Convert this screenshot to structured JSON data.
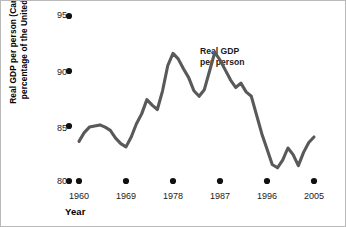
{
  "chart_data": {
    "type": "line",
    "title": "",
    "xlabel": "Year",
    "ylabel": "Real GDP per person (Canada as a percentage of the United States)",
    "annotation": "Real GDP per person",
    "annotation_line1": "Real GDP",
    "annotation_line2": "per person",
    "series_name": "Real GDP per person",
    "series_color": "#595959",
    "grid": false,
    "legend": "none",
    "xlim": [
      1960,
      2005
    ],
    "ylim": [
      80,
      95
    ],
    "xticks": [
      1960,
      1969,
      1978,
      1987,
      1996,
      2005
    ],
    "xtick_labels": [
      "1960",
      "1969",
      "1978",
      "1987",
      "1996",
      "2005"
    ],
    "yticks": [
      80,
      85,
      90,
      95
    ],
    "ytick_labels": [
      "80",
      "85",
      "90",
      "95"
    ],
    "x": [
      1960,
      1961,
      1962,
      1963,
      1964,
      1965,
      1966,
      1967,
      1968,
      1969,
      1970,
      1971,
      1972,
      1973,
      1974,
      1975,
      1976,
      1977,
      1978,
      1979,
      1980,
      1981,
      1982,
      1983,
      1984,
      1985,
      1986,
      1987,
      1988,
      1989,
      1990,
      1991,
      1992,
      1993,
      1994,
      1995,
      1996,
      1997,
      1998,
      1999,
      2000,
      2001,
      2002,
      2003,
      2004,
      2005
    ],
    "values": [
      83.6,
      84.4,
      84.9,
      85.0,
      85.1,
      84.9,
      84.6,
      83.9,
      83.4,
      83.1,
      84.0,
      85.2,
      86.1,
      87.4,
      86.9,
      86.5,
      88.2,
      90.5,
      91.6,
      91.1,
      90.2,
      89.4,
      88.2,
      87.7,
      88.3,
      90.0,
      91.7,
      91.0,
      90.1,
      89.2,
      88.5,
      88.9,
      88.1,
      87.7,
      86.0,
      84.3,
      82.9,
      81.5,
      81.2,
      81.9,
      83.0,
      82.4,
      81.4,
      82.6,
      83.5,
      84.0
    ],
    "values_tail": [
      85.1,
      85.6,
      86.2,
      86.6,
      85.1
    ],
    "note": "Line shows Canadian real GDP per person as a percentage of the United States, 1960-2005"
  },
  "axis": {
    "y_label": "Real GDP per person (Canada as a percentage of the United States)",
    "x_label": "Year"
  }
}
